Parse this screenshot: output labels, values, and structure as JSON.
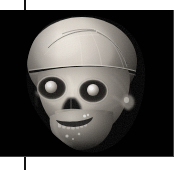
{
  "figure": {
    "kind": "volume-rendered-ct-skull",
    "caption": "",
    "background_color": "#010101",
    "page_color": "#ffffff",
    "panel": {
      "x": 0,
      "y": 10,
      "width": 174,
      "height": 147
    },
    "rule": {
      "x": 24,
      "width": 2,
      "color": "#141414"
    },
    "render": {
      "modality": "CT",
      "rendering": "3D surface / volume rendering",
      "colormap": "grayscale",
      "view": "anterior oblique (three-quarter) facing viewer's left",
      "subject": "human skull with soft-tissue remnants",
      "intensity_range": {
        "min": 0,
        "max": 255
      },
      "highlight_gray": "#f2efe9",
      "midtone_gray": "#9a948c",
      "shadow_gray": "#2b2926"
    },
    "anatomy": [
      {
        "name": "calvaria",
        "label": "cranial vault",
        "brightness": "high"
      },
      {
        "name": "coronal-suture",
        "label": "suture lines",
        "brightness": "medium"
      },
      {
        "name": "craniotomy-cut",
        "label": "horizontal saw cut across vault",
        "brightness": "dark"
      },
      {
        "name": "left-orbit",
        "label": "orbit with globe",
        "brightness": "very high"
      },
      {
        "name": "right-orbit",
        "label": "orbit with globe",
        "brightness": "very high"
      },
      {
        "name": "nasal-aperture",
        "label": "nasal aperture",
        "brightness": "dark"
      },
      {
        "name": "zygomatic-arch",
        "label": "zygomatic arch",
        "brightness": "medium"
      },
      {
        "name": "maxilla-teeth",
        "label": "upper dentition",
        "brightness": "high"
      },
      {
        "name": "mandible-teeth",
        "label": "lower dentition",
        "brightness": "high"
      },
      {
        "name": "mandible",
        "label": "mandible",
        "brightness": "medium"
      },
      {
        "name": "dental-restorations",
        "label": "bright dental restorations",
        "brightness": "very high"
      }
    ]
  }
}
